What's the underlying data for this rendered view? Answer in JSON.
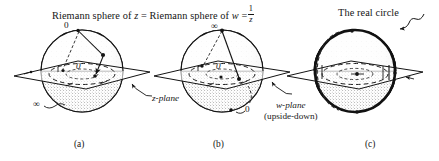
{
  "figure": {
    "title_part1": "Riemann sphere of",
    "title_var_z": "z",
    "title_equals": "=",
    "title_part2": "Riemann sphere of",
    "title_var_w": "w",
    "title_eq2": "=",
    "fraction_numerator": "1",
    "fraction_denominator": "z",
    "real_circle_label": "The real circle",
    "z_plane_label": "z-plane",
    "w_plane_label": "w-plane",
    "w_plane_sub": "(upside-down)",
    "panels": [
      {
        "caption": "(a)",
        "top_label": "0",
        "bottom_label": "∞",
        "plane_label": "z-plane"
      },
      {
        "caption": "(b)",
        "top_label": "∞",
        "bottom_label": "0",
        "plane_label": "w-plane"
      },
      {
        "caption": "(c)",
        "top_label": "",
        "bottom_label": "",
        "plane_label": ""
      }
    ],
    "origin_marks": [
      "0",
      "0"
    ],
    "colors": {
      "ink": "#141414",
      "paper": "#ffffff",
      "stipple": "#6e6e6e",
      "dash": "#2a2a2a"
    }
  }
}
